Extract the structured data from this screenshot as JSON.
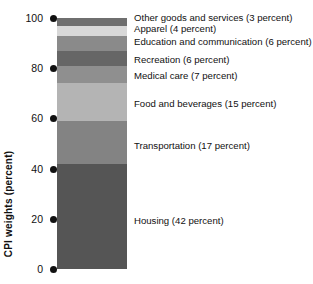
{
  "chart_data": {
    "type": "bar",
    "title": "",
    "subtitle": "",
    "xlabel": "",
    "ylabel": "CPI weights (percent)",
    "ylim": [
      0,
      100
    ],
    "grid": false,
    "legend_position": "right-inline",
    "stacked": true,
    "categories": [
      "CPI"
    ],
    "yticks": [
      "0",
      "20",
      "40",
      "60",
      "80",
      "100"
    ],
    "segments": [
      {
        "label": "Other goods and services (3 percent)",
        "name": "Other goods and services",
        "value": 3,
        "color": "#6f6f6f",
        "top": 100,
        "bottom": 97
      },
      {
        "label": "Apparel (4 percent)",
        "name": "Apparel",
        "value": 4,
        "color": "#d8d8d8",
        "top": 97,
        "bottom": 93
      },
      {
        "label": "Education and communication (6 percent)",
        "name": "Education and communication",
        "value": 6,
        "color": "#8a8a8a",
        "top": 93,
        "bottom": 87
      },
      {
        "label": "Recreation (6 percent)",
        "name": "Recreation",
        "value": 6,
        "color": "#666666",
        "top": 87,
        "bottom": 81
      },
      {
        "label": "Medical care (7 percent)",
        "name": "Medical care",
        "value": 7,
        "color": "#8f8f8f",
        "top": 81,
        "bottom": 74
      },
      {
        "label": "Food and beverages (15 percent)",
        "name": "Food and beverages",
        "value": 15,
        "color": "#b4b4b4",
        "top": 74,
        "bottom": 59
      },
      {
        "label": "Transportation (17 percent)",
        "name": "Transportation",
        "value": 17,
        "color": "#838383",
        "top": 59,
        "bottom": 42
      },
      {
        "label": "Housing (42 percent)",
        "name": "Housing",
        "value": 42,
        "color": "#555555",
        "top": 42,
        "bottom": 0
      }
    ]
  },
  "axis": {
    "title": "CPI weights (percent)",
    "ticks": [
      {
        "label": "100",
        "value": 100
      },
      {
        "label": "80",
        "value": 80
      },
      {
        "label": "60",
        "value": 60
      },
      {
        "label": "40",
        "value": 40
      },
      {
        "label": "20",
        "value": 20
      },
      {
        "label": "0",
        "value": 0
      }
    ]
  },
  "labels": [
    {
      "text": "Other goods and services (3 percent)",
      "y": 12
    },
    {
      "text": "Apparel (4 percent)",
      "y": 23
    },
    {
      "text": "Education and communication (6 percent)",
      "y": 36
    },
    {
      "text": "Recreation (6 percent)",
      "y": 54
    },
    {
      "text": "Medical care (7 percent)",
      "y": 70
    },
    {
      "text": "Food and beverages (15 percent)",
      "y": 98
    },
    {
      "text": "Transportation (17 percent)",
      "y": 140
    },
    {
      "text": "Housing (42 percent)",
      "y": 215
    }
  ]
}
